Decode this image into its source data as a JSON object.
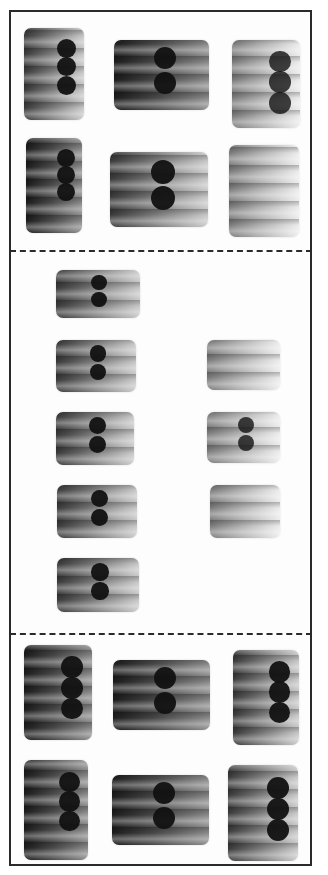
{
  "image": {
    "subject": "Full-mouth dental radiograph series mounted on card",
    "film_count": 18,
    "colors": {
      "border": "#2a2a2a",
      "background": "#ffffff",
      "film_dark": "#111111",
      "film_mid": "#6a6a6a",
      "film_light": "#e8e8e8"
    }
  },
  "sections": [
    {
      "name": "upper-bitewings-periapicals",
      "films": [
        {
          "x": 24,
          "y": 28,
          "w": 60,
          "h": 92,
          "orient": "portrait",
          "tone": "mid"
        },
        {
          "x": 114,
          "y": 40,
          "w": 95,
          "h": 70,
          "orient": "landscape",
          "tone": "dark"
        },
        {
          "x": 232,
          "y": 40,
          "w": 68,
          "h": 88,
          "orient": "portrait",
          "tone": "light"
        },
        {
          "x": 26,
          "y": 138,
          "w": 56,
          "h": 95,
          "orient": "portrait",
          "tone": "dark"
        },
        {
          "x": 110,
          "y": 152,
          "w": 98,
          "h": 75,
          "orient": "landscape",
          "tone": "mid"
        },
        {
          "x": 229,
          "y": 145,
          "w": 70,
          "h": 92,
          "orient": "portrait",
          "tone": "light"
        }
      ]
    },
    {
      "name": "anterior-periapicals",
      "films": [
        {
          "x": 56,
          "y": 270,
          "w": 84,
          "h": 48,
          "orient": "landscape",
          "tone": "mid"
        },
        {
          "x": 56,
          "y": 340,
          "w": 80,
          "h": 52,
          "orient": "landscape",
          "tone": "mid"
        },
        {
          "x": 56,
          "y": 412,
          "w": 78,
          "h": 53,
          "orient": "landscape",
          "tone": "mid"
        },
        {
          "x": 57,
          "y": 485,
          "w": 80,
          "h": 53,
          "orient": "landscape",
          "tone": "mid"
        },
        {
          "x": 57,
          "y": 558,
          "w": 82,
          "h": 54,
          "orient": "landscape",
          "tone": "mid"
        },
        {
          "x": 207,
          "y": 340,
          "w": 73,
          "h": 50,
          "orient": "landscape",
          "tone": "light"
        },
        {
          "x": 207,
          "y": 412,
          "w": 73,
          "h": 51,
          "orient": "landscape",
          "tone": "light"
        },
        {
          "x": 210,
          "y": 485,
          "w": 70,
          "h": 53,
          "orient": "landscape",
          "tone": "light"
        }
      ]
    },
    {
      "name": "lower-bitewings-periapicals",
      "films": [
        {
          "x": 24,
          "y": 645,
          "w": 68,
          "h": 95,
          "orient": "portrait",
          "tone": "dark"
        },
        {
          "x": 113,
          "y": 660,
          "w": 97,
          "h": 70,
          "orient": "landscape",
          "tone": "dark"
        },
        {
          "x": 233,
          "y": 650,
          "w": 66,
          "h": 95,
          "orient": "portrait",
          "tone": "mid"
        },
        {
          "x": 24,
          "y": 760,
          "w": 64,
          "h": 100,
          "orient": "portrait",
          "tone": "dark"
        },
        {
          "x": 112,
          "y": 775,
          "w": 97,
          "h": 70,
          "orient": "landscape",
          "tone": "dark"
        },
        {
          "x": 228,
          "y": 765,
          "w": 70,
          "h": 96,
          "orient": "portrait",
          "tone": "mid"
        }
      ]
    }
  ],
  "dividers": [
    250,
    633
  ]
}
